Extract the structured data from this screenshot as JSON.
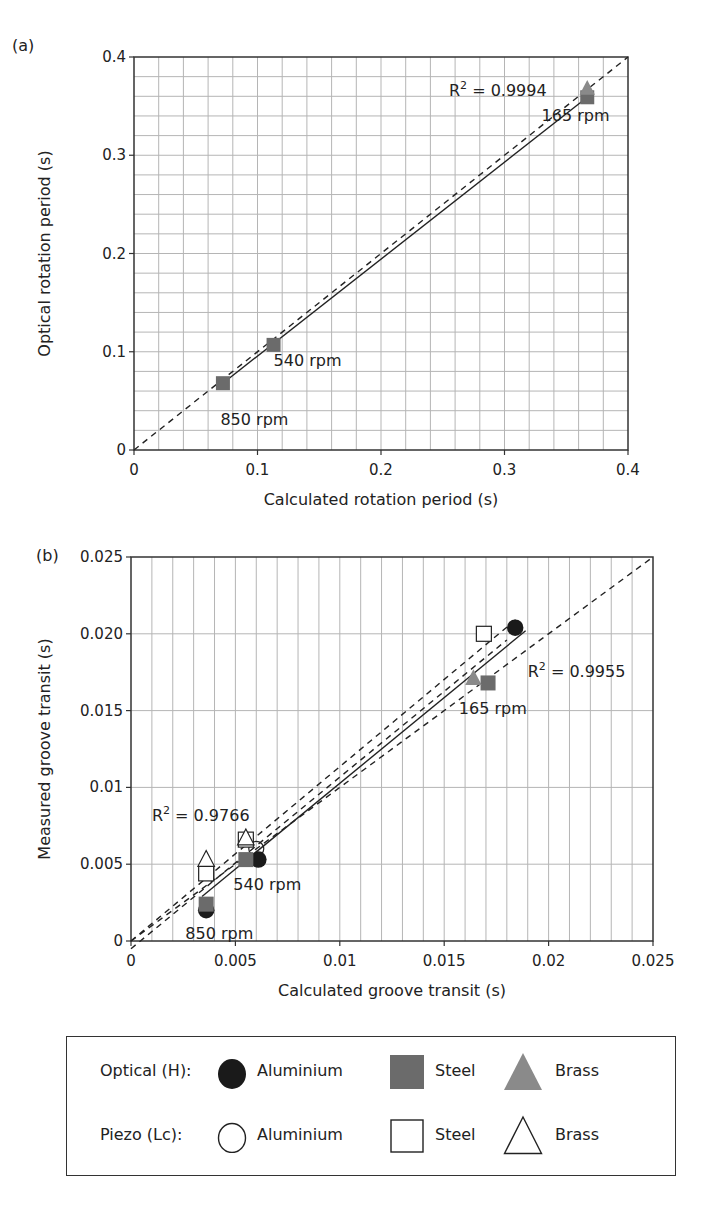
{
  "figure": {
    "panel_a_label": "(a)",
    "panel_b_label": "(b)"
  },
  "colors": {
    "aluminium_optical": "#1a1a1a",
    "steel_optical": "#6b6b6b",
    "brass_optical": "#8a8a8a",
    "open_fill": "#ffffff",
    "open_stroke": "#222222",
    "grid": "#b5b5b5",
    "axis": "#333333"
  },
  "legend": {
    "rows": [
      {
        "label": "Optical (H):",
        "items": [
          {
            "symbol": "filled-circle",
            "label": "Aluminium"
          },
          {
            "symbol": "filled-square",
            "label": "Steel"
          },
          {
            "symbol": "filled-triangle",
            "label": "Brass"
          }
        ]
      },
      {
        "label": "Piezo (Lc):",
        "items": [
          {
            "symbol": "open-circle",
            "label": "Aluminium"
          },
          {
            "symbol": "open-square",
            "label": "Steel"
          },
          {
            "symbol": "open-triangle",
            "label": "Brass"
          }
        ]
      }
    ]
  },
  "chart_data": [
    {
      "panel": "(a)",
      "type": "scatter",
      "title": "",
      "xlabel": "Calculated rotation period (s)",
      "ylabel": "Optical rotation period (s)",
      "xlim": [
        0,
        0.4
      ],
      "ylim": [
        0,
        0.4
      ],
      "xticks": [
        "0",
        "0.1",
        "0.2",
        "0.3",
        "0.4"
      ],
      "yticks": [
        "0",
        "0.1",
        "0.2",
        "0.3",
        "0.4"
      ],
      "grid": true,
      "grid_minor_step_x": 0.02,
      "grid_minor_step_y": 0.02,
      "series": [
        {
          "name": "Optical Steel",
          "marker": "filled-square",
          "points": [
            [
              0.072,
              0.068
            ],
            [
              0.113,
              0.107
            ],
            [
              0.367,
              0.359
            ]
          ]
        },
        {
          "name": "Optical Brass",
          "marker": "filled-triangle",
          "points": [
            [
              0.367,
              0.368
            ]
          ]
        }
      ],
      "fit_line": {
        "style": "solid",
        "from": [
          0.072,
          0.068
        ],
        "to": [
          0.367,
          0.359
        ],
        "r2_label": "R² = 0.9994"
      },
      "identity_line": {
        "style": "dashed",
        "from": [
          0,
          0
        ],
        "to": [
          0.4,
          0.4
        ]
      },
      "annotations": [
        {
          "text": "165 rpm",
          "x": 0.33,
          "y": 0.335
        },
        {
          "text": "540 rpm",
          "x": 0.113,
          "y": 0.085
        },
        {
          "text": "850 rpm",
          "x": 0.07,
          "y": 0.025
        },
        {
          "text": "R",
          "sup": "2",
          "rest": " = 0.9994",
          "x": 0.255,
          "y": 0.36
        }
      ]
    },
    {
      "panel": "(b)",
      "type": "scatter",
      "title": "",
      "xlabel": "Calculated groove transit (s)",
      "ylabel": "Measured groove transit (s)",
      "xlim": [
        0,
        0.025
      ],
      "ylim": [
        0,
        0.025
      ],
      "xticks": [
        "0",
        "0.005",
        "0.01",
        "0.015",
        "0.02",
        "0.025"
      ],
      "yticks": [
        "0",
        "0.005",
        "0.01",
        "0.015",
        "0.020",
        "0.025"
      ],
      "grid": true,
      "grid_minor_step_x": 0.001,
      "grid_minor_step_y": 0.005,
      "series": [
        {
          "name": "Optical Aluminium",
          "marker": "filled-circle",
          "points": [
            [
              0.0036,
              0.002
            ],
            [
              0.0061,
              0.0053
            ],
            [
              0.0184,
              0.0204
            ]
          ]
        },
        {
          "name": "Optical Steel",
          "marker": "filled-square",
          "points": [
            [
              0.0036,
              0.0024
            ],
            [
              0.0055,
              0.0053
            ],
            [
              0.0171,
              0.0168
            ]
          ]
        },
        {
          "name": "Optical Brass",
          "marker": "filled-triangle",
          "points": [
            [
              0.0164,
              0.0171
            ]
          ]
        },
        {
          "name": "Piezo Aluminium",
          "marker": "open-circle",
          "points": [
            [
              0.006,
              0.006
            ]
          ]
        },
        {
          "name": "Piezo Steel",
          "marker": "open-square",
          "points": [
            [
              0.0036,
              0.0044
            ],
            [
              0.0055,
              0.0066
            ],
            [
              0.0169,
              0.02
            ]
          ]
        },
        {
          "name": "Piezo Brass",
          "marker": "open-triangle",
          "points": [
            [
              0.0036,
              0.0053
            ],
            [
              0.0055,
              0.0067
            ]
          ]
        }
      ],
      "fit_line": {
        "style": "solid",
        "from": [
          0.0034,
          0.0029
        ],
        "to": [
          0.0189,
          0.0202
        ],
        "r2_label": "R² = 0.9955"
      },
      "fit_line_upper": {
        "style": "dashed",
        "from": [
          0.0,
          0.0
        ],
        "to": [
          0.0185,
          0.021
        ]
      },
      "fit_line_lower": {
        "style": "dashed",
        "from": [
          0.0,
          0.0
        ],
        "to": [
          0.025,
          0.025
        ]
      },
      "confidence_dashed": {
        "style": "dashed",
        "from": [
          0.0,
          -0.0005
        ],
        "to": [
          0.018,
          0.0196
        ]
      },
      "identity_line": {
        "style": "dashed",
        "from": [
          0,
          0
        ],
        "to": [
          0.025,
          0.025
        ]
      },
      "annotations": [
        {
          "text": "165 rpm",
          "x": 0.0157,
          "y": 0.0148
        },
        {
          "text": "540 rpm",
          "x": 0.0049,
          "y": 0.0033
        },
        {
          "text": "850 rpm",
          "x": 0.0026,
          "y": 0.0001
        },
        {
          "text": "R",
          "sup": "2",
          "rest": " = 0.9955",
          "x": 0.019,
          "y": 0.0172
        },
        {
          "text": "R",
          "sup": "2",
          "rest": " = 0.9766",
          "x": 0.001,
          "y": 0.0078
        }
      ]
    }
  ]
}
